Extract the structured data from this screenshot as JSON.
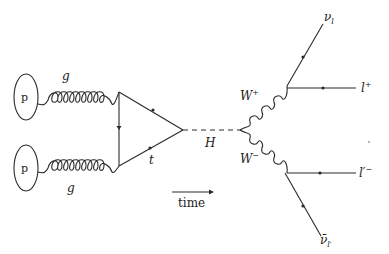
{
  "diagram": {
    "type": "feynman",
    "title": "",
    "protons": [
      {
        "label": "p",
        "position": "top"
      },
      {
        "label": "p",
        "position": "bottom"
      }
    ],
    "gluons": [
      {
        "label": "g",
        "position": "top"
      },
      {
        "label": "g",
        "position": "bottom"
      }
    ],
    "loop": {
      "label": "t"
    },
    "higgs": {
      "label": "H"
    },
    "w_bosons": {
      "plus": {
        "base": "W",
        "sup": "+"
      },
      "minus": {
        "base": "W",
        "sup": "−"
      }
    },
    "leptons": {
      "nu_l": {
        "base": "ν",
        "sub": "l"
      },
      "l_plus": {
        "base": "l",
        "sup": "+"
      },
      "l_prime_minus": {
        "base": "l′",
        "sup": "−"
      },
      "nu_bar_lprime": {
        "base": "ν̄",
        "sub": "l′"
      }
    },
    "time_label": "time",
    "colors": {
      "line": "#2a2a2a",
      "background": "#ffffff"
    }
  }
}
